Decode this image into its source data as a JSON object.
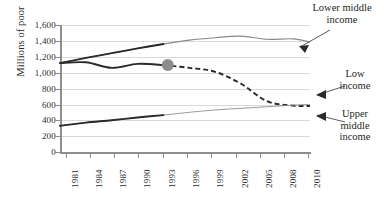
{
  "chart_data": {
    "type": "line",
    "title": "",
    "xlabel": "",
    "ylabel": "Millions of poor",
    "xlim": [
      1981,
      2010
    ],
    "ylim": [
      0,
      1600
    ],
    "grid": true,
    "legend_position": "annotations-right",
    "x_ticks": [
      "1981",
      "1984",
      "1987",
      "1990",
      "1993",
      "1996",
      "1999",
      "2002",
      "2005",
      "2008",
      "2010"
    ],
    "y_ticks": [
      "0",
      "200",
      "400",
      "600",
      "800",
      "1,000",
      "1,200",
      "1,400",
      "1,600"
    ],
    "series": [
      {
        "name": "Low income",
        "color": "#2a2a2a",
        "style": "solid-thick-then-thin",
        "x": [
          1981,
          1984,
          1987,
          1990,
          1993,
          1996,
          1999,
          2002,
          2005,
          2008,
          2010
        ],
        "values": [
          1120,
          1130,
          1060,
          1110,
          1095,
          1060,
          1010,
          860,
          640,
          585,
          580
        ]
      },
      {
        "name": "Lower middle income",
        "color": "#8a8a8a",
        "style": "solid-thin",
        "x": [
          1981,
          1984,
          1987,
          1990,
          1993,
          1996,
          1999,
          2002,
          2005,
          2008,
          2010
        ],
        "values": [
          1120,
          1185,
          1245,
          1305,
          1360,
          1410,
          1440,
          1460,
          1420,
          1425,
          1385
        ]
      },
      {
        "name": "Upper middle income",
        "color": "#2a2a2a",
        "style": "dashed-after-1993",
        "x": [
          1981,
          1984,
          1987,
          1990,
          1993,
          1996,
          1999,
          2002,
          2005,
          2008,
          2010
        ],
        "values": [
          330,
          370,
          400,
          435,
          465,
          500,
          530,
          550,
          570,
          590,
          600
        ]
      }
    ],
    "marker": {
      "name": "highlight-dot",
      "x": 1993.5,
      "y": 1095,
      "color": "#8c8c8c",
      "radius": 6
    },
    "annotations": [
      {
        "name": "lower-middle-income",
        "text": "Lower middle\nincome"
      },
      {
        "name": "low-income",
        "text": "Low\nincome"
      },
      {
        "name": "upper-middle-income",
        "text": "Upper\nmiddle\nincome"
      }
    ]
  },
  "axis": {
    "y_title": "Millions of poor",
    "y_ticks": [
      "1,600",
      "1,400",
      "1,200",
      "1,000",
      "800",
      "600",
      "400",
      "200",
      "0"
    ],
    "x_ticks": [
      "1981",
      "1984",
      "1987",
      "1990",
      "1993",
      "1996",
      "1999",
      "2002",
      "2005",
      "2008",
      "2010"
    ]
  },
  "annotations": {
    "lower_middle": "Lower middle\nincome",
    "low": "Low\nincome",
    "upper_middle": "Upper\nmiddle\nincome"
  }
}
